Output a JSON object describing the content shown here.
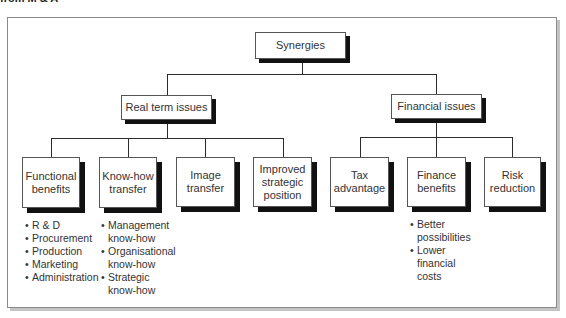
{
  "caption": "from M & A",
  "root": {
    "label": "Synergies"
  },
  "level1": [
    {
      "label": "Real term issues"
    },
    {
      "label": "Financial issues"
    }
  ],
  "level2": [
    {
      "label": "Functional benefits",
      "parent": "Real term issues"
    },
    {
      "label": "Know-how transfer",
      "parent": "Real term issues"
    },
    {
      "label": "Image transfer",
      "parent": "Real term issues"
    },
    {
      "label": "Improved strategic position",
      "parent": "Real term issues"
    },
    {
      "label": "Tax advantage",
      "parent": "Financial issues"
    },
    {
      "label": "Finance benefits",
      "parent": "Financial issues"
    },
    {
      "label": "Risk reduction",
      "parent": "Financial issues"
    }
  ],
  "lists": {
    "functional": [
      "R & D",
      "Procurement",
      "Production",
      "Marketing",
      "Administration"
    ],
    "knowhow": [
      "Management\nknow-how",
      "Organisational\nknow-how",
      "Strategic\nknow-how"
    ],
    "finance": [
      "Better\npossibilities",
      "Lower\nfinancial\ncosts"
    ]
  },
  "bullet": "•",
  "colors": {
    "box_border": "#555555",
    "box_shadow": "#111111",
    "line": "#2b2b2b",
    "frame": "#8a8a8a"
  }
}
